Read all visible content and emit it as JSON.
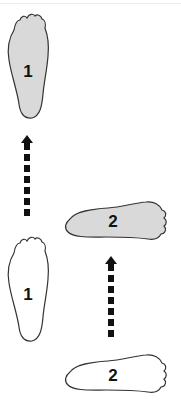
{
  "diagram": {
    "type": "footstep-sequence",
    "colors": {
      "filled_foot": "#d9d9d9",
      "outline_foot": "#ffffff",
      "stroke": "#333333",
      "arrow": "#111111"
    },
    "steps": [
      {
        "id": "foot-1-start",
        "label": "1",
        "state": "outline",
        "orientation": "vertical"
      },
      {
        "id": "foot-1-end",
        "label": "1",
        "state": "filled",
        "orientation": "vertical"
      },
      {
        "id": "foot-2-start",
        "label": "2",
        "state": "outline",
        "orientation": "horizontal"
      },
      {
        "id": "foot-2-end",
        "label": "2",
        "state": "filled",
        "orientation": "horizontal"
      }
    ],
    "arrows": [
      {
        "id": "arrow-1",
        "from": "foot-1-start",
        "to": "foot-1-end",
        "style": "dashed",
        "direction": "up"
      },
      {
        "id": "arrow-2",
        "from": "foot-2-start",
        "to": "foot-2-end",
        "style": "dashed",
        "direction": "up"
      }
    ]
  }
}
